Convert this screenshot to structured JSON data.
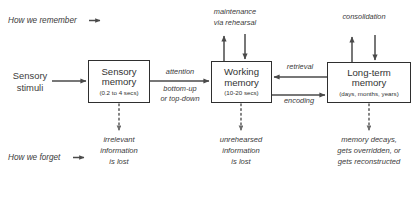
{
  "diagram": {
    "stroke_color": "#4a4a4a",
    "box_border_color": "#2f2f2f",
    "text_color": "#3b3b3b",
    "background": "#ffffff"
  },
  "headers": {
    "remember": "How we remember",
    "forget": "How we forget"
  },
  "boxes": [
    {
      "id": "sensory-memory",
      "line1": "Sensory",
      "line2": "memory",
      "sub": "(0.2 to 4 secs)"
    },
    {
      "id": "working-memory",
      "line1": "Working",
      "line2": "memory",
      "sub": "(10-20 secs)"
    },
    {
      "id": "long-term-memory",
      "line1": "Long-term",
      "line2": "memory",
      "sub": "(days, months, years)"
    }
  ],
  "input": {
    "line1": "Sensory",
    "line2": "stimuli"
  },
  "edges": {
    "attention": "attention",
    "attention_sub1": "bottom-up",
    "attention_sub2": "or top-down",
    "retrieval": "retrieval",
    "encoding": "encoding",
    "maintenance1": "maintenance",
    "maintenance2": "via rehearsal",
    "consolidation": "consolidation"
  },
  "losses": [
    {
      "id": "sensory-loss",
      "line1": "irrelevant",
      "line2": "information",
      "line3": "is lost"
    },
    {
      "id": "working-loss",
      "line1": "unrehearsed",
      "line2": "information",
      "line3": "is lost"
    },
    {
      "id": "longterm-loss",
      "line1": "memory decays,",
      "line2": "gets overridden, or",
      "line3": "gets reconstructed"
    }
  ]
}
